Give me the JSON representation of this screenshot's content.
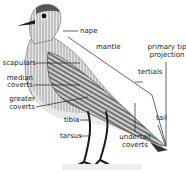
{
  "diagram": {
    "labels": {
      "nape": "nape",
      "mantle": "mantle",
      "primary_tip_projection_1": "primary tip",
      "primary_tip_projection_2": "projection",
      "tertials": "tertials",
      "scapulars": "scapulars",
      "median_coverts_1": "median",
      "median_coverts_2": "coverts",
      "greater_coverts_1": "greater",
      "greater_coverts_2": "coverts",
      "tail": "tail",
      "tibia": "tibia",
      "tarsus": "tarsus",
      "undertail_coverts_1": "undertail",
      "undertail_coverts_2": "coverts"
    },
    "colors": {
      "background": "#ffffff",
      "ink": "#222222",
      "plumage_dark": "#3a3a3a",
      "plumage_light": "#d8d8d8"
    }
  }
}
